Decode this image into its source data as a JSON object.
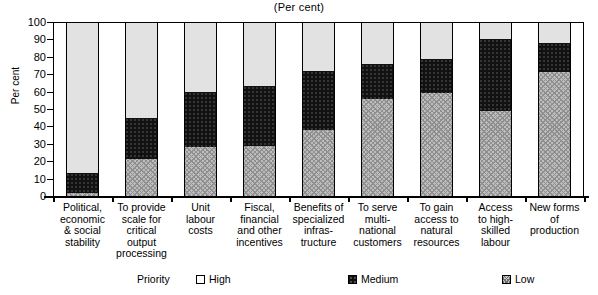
{
  "chart_data": {
    "type": "bar",
    "subtype": "stacked-bar-100-percent",
    "title": "(Per cent)",
    "xlabel": "",
    "ylabel": "Per cent",
    "ylim": [
      0,
      100
    ],
    "ytick_values": [
      0,
      10,
      20,
      30,
      40,
      50,
      60,
      70,
      80,
      90,
      100
    ],
    "ytick_labels": [
      "0",
      "10",
      "20",
      "30",
      "40",
      "50",
      "60",
      "70",
      "80",
      "90",
      "100"
    ],
    "grid": false,
    "legend_position": "bottom",
    "legend_title": "Priority",
    "categories": [
      "Political,\neconomic\n& social\nstability",
      "To provide\nscale for\ncritical\noutput\nprocessing",
      "Unit\nlabour\ncosts",
      "Fiscal,\nfinancial\nand other\nincentives",
      "Benefits of\nspecialized\ninfras-\ntructure",
      "To serve\nmulti-\nnational\ncustomers",
      "To gain\naccess to\nnatural\nresources",
      "Access\nto high-\nskilled\nlabour",
      "New forms\nof\nproduction"
    ],
    "series": [
      {
        "name": "High",
        "pattern": "light-stipple",
        "color": "#e2e2e2",
        "values": [
          87,
          55,
          40,
          37,
          28,
          24,
          21,
          10,
          12
        ]
      },
      {
        "name": "Medium",
        "pattern": "solid-black",
        "color": "#111111",
        "values": [
          11,
          24,
          32,
          34,
          34,
          20,
          20,
          41,
          17
        ]
      },
      {
        "name": "Low",
        "pattern": "cross-hatch",
        "color": "#bdbdbd",
        "values": [
          2,
          21,
          28,
          29,
          38,
          56,
          59,
          49,
          71
        ]
      }
    ]
  },
  "chart": {
    "title": "(Per cent)",
    "y_axis_title": "Per cent"
  },
  "legend": {
    "title": "Priority",
    "items": [
      {
        "label": "High",
        "swatch": "swatch-high-icon"
      },
      {
        "label": "Medium",
        "swatch": "swatch-medium-icon"
      },
      {
        "label": "Low",
        "swatch": "swatch-low-icon"
      }
    ]
  }
}
